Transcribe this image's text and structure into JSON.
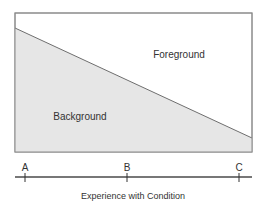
{
  "diagram": {
    "regions": {
      "foreground": "Foreground",
      "background": "Background"
    },
    "axis": {
      "title": "Experience with Condition",
      "ticks": [
        {
          "label": "A"
        },
        {
          "label": "B"
        },
        {
          "label": "C"
        }
      ]
    },
    "colors": {
      "background_fill": "#e6e6e6",
      "foreground_fill": "#ffffff",
      "border": "#8a8a8a",
      "divider": "#6e6e6e",
      "axis": "#777777"
    }
  }
}
